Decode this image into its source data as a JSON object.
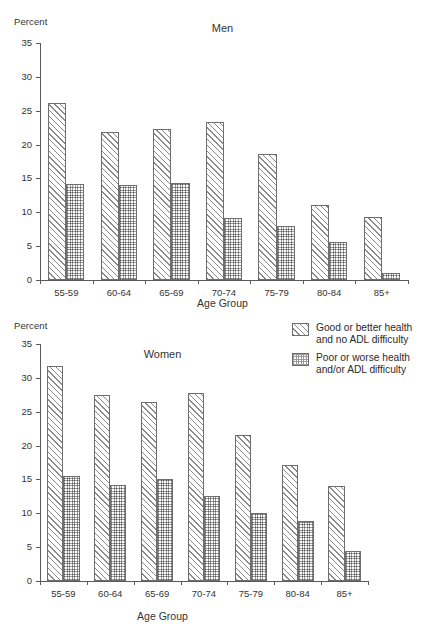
{
  "chart_data": [
    {
      "type": "bar",
      "title": "Men",
      "xlabel": "Age Group",
      "ylabel": "Percent",
      "ylim": [
        0,
        35
      ],
      "yticks": [
        0,
        5,
        10,
        15,
        20,
        25,
        30,
        35
      ],
      "grid": false,
      "legend_position": "right",
      "categories": [
        "55-59",
        "60-64",
        "65-69",
        "70-74",
        "75-79",
        "80-84",
        "85+"
      ],
      "series": [
        {
          "name": "Good or better health and no ADL difficulty",
          "pattern": "diagonal-hatch",
          "values": [
            26.2,
            21.9,
            22.3,
            23.4,
            18.6,
            11.1,
            9.3
          ]
        },
        {
          "name": "Poor or worse health and/or ADL difficulty",
          "pattern": "cross-hatch",
          "values": [
            14.2,
            14.1,
            14.3,
            9.2,
            8.0,
            5.6,
            1.1
          ]
        }
      ]
    },
    {
      "type": "bar",
      "title": "Women",
      "xlabel": "Age Group",
      "ylabel": "Percent",
      "ylim": [
        0,
        35
      ],
      "yticks": [
        0,
        5,
        10,
        15,
        20,
        25,
        30,
        35
      ],
      "grid": false,
      "legend_position": "right",
      "categories": [
        "55-59",
        "60-64",
        "65-69",
        "70-74",
        "75-79",
        "80-84",
        "85+"
      ],
      "series": [
        {
          "name": "Good or better health and no ADL difficulty",
          "pattern": "diagonal-hatch",
          "values": [
            31.8,
            27.4,
            26.5,
            27.7,
            21.6,
            17.2,
            14.1
          ]
        },
        {
          "name": "Poor or worse health and/or ADL difficulty",
          "pattern": "cross-hatch",
          "values": [
            15.5,
            14.2,
            15.1,
            12.5,
            10.0,
            8.9,
            4.4
          ]
        }
      ]
    }
  ],
  "men_panel": {
    "percent_label": "Percent",
    "title": "Men",
    "xlabel": "Age Group"
  },
  "women_panel": {
    "percent_label": "Percent",
    "title": "Women",
    "xlabel": "Age Group"
  },
  "legend": {
    "items": [
      {
        "label": "Good or better health\nand no ADL difficulty",
        "pattern": "diagonal-hatch"
      },
      {
        "label": "Poor or worse health\nand/or ADL difficulty",
        "pattern": "cross-hatch"
      }
    ]
  },
  "colors": {
    "axis": "#5a5a5a",
    "bar_outline": "#6e6e6e",
    "hatch": "#8a8a8a",
    "text": "#2b2b2b",
    "background": "#ffffff"
  }
}
